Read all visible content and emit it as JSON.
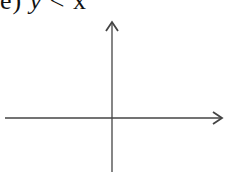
{
  "problem": {
    "label_prefix": "e)",
    "lhs": "y",
    "operator": "<",
    "rhs": "x"
  },
  "axes": {
    "x_axis": {
      "from": [
        5,
        118
      ],
      "to": [
        222,
        118
      ],
      "arrow": "right"
    },
    "y_axis": {
      "from": [
        112,
        172
      ],
      "to": [
        112,
        22
      ],
      "arrow": "up"
    },
    "color": "#444444"
  }
}
